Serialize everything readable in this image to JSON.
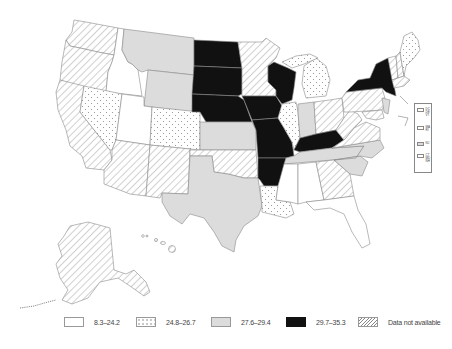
{
  "map": {
    "type": "choropleth",
    "region": "United States",
    "colors": {
      "range1": "#ffffff",
      "range2_dotted": "#ffffff",
      "range3": "#dcdcdc",
      "range4": "#111111",
      "hatched": "#ffffff",
      "border": "#8a8a8a"
    }
  },
  "legend": {
    "items": [
      {
        "label": "8.3–24.2",
        "pattern": "white"
      },
      {
        "label": "24.8–26.7",
        "pattern": "dotted"
      },
      {
        "label": "27.6–29.4",
        "pattern": "light-gray"
      },
      {
        "label": "29.7–35.3",
        "pattern": "black"
      },
      {
        "label": "Data not available",
        "pattern": "hatched"
      }
    ]
  },
  "inset_legend": {
    "rows": [
      {
        "states": [
          "DC",
          "DE",
          "VT"
        ],
        "pattern": "white"
      },
      {
        "states": [
          "MA",
          "RI"
        ],
        "pattern": "white"
      },
      {
        "states": [
          "NJ"
        ],
        "pattern": "light-gray"
      },
      {
        "states": [
          "CT",
          "MD",
          "NH"
        ],
        "pattern": "dotted"
      }
    ]
  },
  "states": {
    "white": [
      "ID",
      "UT",
      "MS",
      "AL",
      "FL"
    ],
    "dotted": [
      "NV",
      "CO",
      "IL",
      "MI",
      "LA",
      "ME"
    ],
    "light_gray": [
      "MT",
      "WY",
      "KS",
      "TX",
      "IN",
      "TN",
      "NC",
      "SC",
      "NJ"
    ],
    "black": [
      "ND",
      "SD",
      "NE",
      "IA",
      "MO",
      "AR",
      "WI",
      "KY",
      "NY"
    ],
    "hatched": [
      "WA",
      "OR",
      "CA",
      "AZ",
      "NM",
      "OK",
      "MN",
      "OH",
      "PA",
      "WV",
      "VA",
      "GA",
      "AK",
      "HI",
      "VT",
      "MA"
    ]
  }
}
